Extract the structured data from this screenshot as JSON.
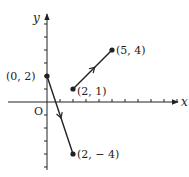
{
  "diagram": {
    "type": "coordinate-plane",
    "axes": {
      "x_label": "x",
      "y_label": "y",
      "origin_label": "O"
    },
    "origin_px": [
      47,
      102
    ],
    "unit_px": 13,
    "x_ticks": [
      1,
      2,
      3,
      4,
      5,
      6,
      7,
      8,
      9,
      10
    ],
    "y_ticks": [
      -5,
      -4,
      -3,
      -2,
      -1,
      1,
      2,
      3,
      4,
      5,
      6
    ],
    "segments": [
      {
        "from": [
          0,
          2
        ],
        "to": [
          2,
          -4
        ],
        "from_label": "(0, 2)",
        "to_label": "(2, − 4)"
      },
      {
        "from": [
          2,
          1
        ],
        "to": [
          5,
          4
        ],
        "from_label": "(2, 1)",
        "to_label": "(5, 4)"
      }
    ],
    "color": "#222222"
  }
}
